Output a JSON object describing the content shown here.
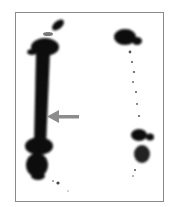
{
  "image": {
    "kind": "bone-scintigraphy",
    "frame_color": "#8a8a8a",
    "uptake_color": "#0a0a0a",
    "arrow_color": "#8c8c8c",
    "annotation": {
      "type": "arrow",
      "points_to": "left-femur-shaft"
    }
  }
}
